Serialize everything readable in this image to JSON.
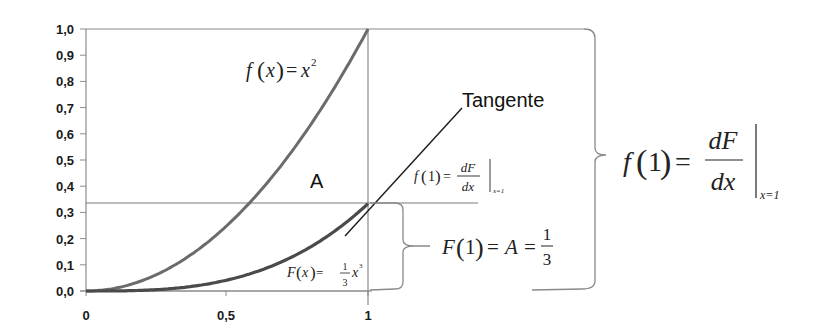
{
  "chart_data": {
    "type": "line",
    "title": "",
    "xlabel": "",
    "ylabel": "",
    "xlim": [
      0,
      1
    ],
    "ylim": [
      0,
      1
    ],
    "x_ticks": [
      "0",
      "0,5",
      "1"
    ],
    "y_ticks": [
      "0,0",
      "0,1",
      "0,2",
      "0,3",
      "0,4",
      "0,5",
      "0,6",
      "0,7",
      "0,8",
      "0,9",
      "1,0"
    ],
    "grid": false,
    "series": [
      {
        "name": "f(x) = x²",
        "x": [
          0,
          0.1,
          0.2,
          0.3,
          0.4,
          0.5,
          0.6,
          0.7,
          0.8,
          0.9,
          1.0
        ],
        "values": [
          0,
          0.01,
          0.04,
          0.09,
          0.16,
          0.25,
          0.36,
          0.49,
          0.64,
          0.81,
          1.0
        ]
      },
      {
        "name": "F(x) = 1/3 x³",
        "x": [
          0,
          0.1,
          0.2,
          0.3,
          0.4,
          0.5,
          0.6,
          0.7,
          0.8,
          0.9,
          1.0
        ],
        "values": [
          0,
          0.0003,
          0.0027,
          0.009,
          0.0213,
          0.0417,
          0.072,
          0.1143,
          0.1707,
          0.243,
          0.3333
        ]
      },
      {
        "name": "Tangente",
        "x": [
          0.92,
          1.35
        ],
        "values": [
          0.253,
          0.683
        ]
      }
    ],
    "reference_lines": [
      {
        "orientation": "horizontal",
        "y": 0.3333
      },
      {
        "orientation": "horizontal",
        "y": 1.0
      },
      {
        "orientation": "vertical",
        "x": 1.0
      }
    ],
    "annotations": [
      "f(x) = x²",
      "Tangente",
      "A",
      "f(1) = dF/dx |x=1",
      "F(x) = 1/3 x³",
      "F(1) = A = 1/3",
      "f(1) = dF/dx |x=1"
    ]
  },
  "labels": {
    "fx_func": "f",
    "fx_arg": "x",
    "fx_rhs": "x",
    "fx_exp": "2",
    "tangent": "Tangente",
    "area": "A",
    "small_f1_lhs": "f",
    "small_f1_arg": "1",
    "small_num": "dF",
    "small_den": "dx",
    "small_sub": "x=1",
    "Fx_func": "F",
    "Fx_arg": "x",
    "Fx_num": "1",
    "Fx_den": "3",
    "Fx_rhs": "x",
    "Fx_exp": "3",
    "F1_func": "F",
    "F1_arg": "1",
    "F1_mid": "A",
    "F1_num": "1",
    "F1_den": "3",
    "big_f": "f",
    "big_arg": "1",
    "big_num": "dF",
    "big_den": "dx",
    "big_sub": "x=1",
    "eq": "="
  },
  "colors": {
    "curve": "#6b6b6b",
    "curve_dark": "#4a4a4a",
    "axis": "#8c8c8c",
    "guide": "#7a7a7a",
    "tangent": "#1a1a1a",
    "text": "#1a1a1a"
  }
}
